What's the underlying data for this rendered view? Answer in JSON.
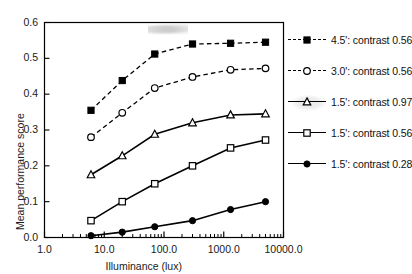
{
  "chart_data": {
    "type": "line",
    "title": "",
    "xlabel": "Illuminance (lux)",
    "ylabel": "Mean performance score",
    "x_scale": "log",
    "xlim": [
      1.0,
      10000.0
    ],
    "ylim": [
      0.0,
      0.6
    ],
    "grid": false,
    "legend_position": "right",
    "x_tick_labels": [
      "1.0",
      "10.0",
      "100.0",
      "1000.0",
      "10000.0"
    ],
    "x_tick_values": [
      1.0,
      10.0,
      100.0,
      1000.0,
      10000.0
    ],
    "y_tick_labels": [
      "0.0",
      "0.1",
      "0.2",
      "0.3",
      "0.4",
      "0.5",
      "0.6"
    ],
    "y_tick_values": [
      0.0,
      0.1,
      0.2,
      0.3,
      0.4,
      0.5,
      0.6
    ],
    "x": [
      6.0,
      20.0,
      70.0,
      300.0,
      1300.0,
      5000.0
    ],
    "series": [
      {
        "name": "4.5': contrast 0.56",
        "marker": "filled-square",
        "linestyle": "dashed",
        "color": "#000000",
        "values": [
          0.355,
          0.438,
          0.512,
          0.54,
          0.542,
          0.545
        ]
      },
      {
        "name": "3.0': contrast 0.56",
        "marker": "open-circle",
        "linestyle": "dashed",
        "color": "#000000",
        "values": [
          0.28,
          0.348,
          0.417,
          0.448,
          0.468,
          0.472
        ]
      },
      {
        "name": "1.5': contrast 0.97",
        "marker": "open-triangle",
        "linestyle": "solid",
        "color": "#000000",
        "values": [
          0.175,
          0.228,
          0.288,
          0.32,
          0.342,
          0.345
        ]
      },
      {
        "name": "1.5': contrast 0.56",
        "marker": "open-square",
        "linestyle": "solid",
        "color": "#000000",
        "values": [
          0.047,
          0.1,
          0.15,
          0.2,
          0.25,
          0.272
        ]
      },
      {
        "name": "1.5': contrast 0.28",
        "marker": "filled-circle",
        "linestyle": "solid",
        "color": "#000000",
        "values": [
          0.005,
          0.015,
          0.03,
          0.047,
          0.078,
          0.1
        ]
      }
    ]
  },
  "legend": {
    "items": [
      {
        "label": "4.5': contrast 0.56"
      },
      {
        "label": "3.0': contrast 0.56"
      },
      {
        "label": "1.5': contrast 0.97"
      },
      {
        "label": "1.5': contrast 0.56"
      },
      {
        "label": "1.5': contrast 0.28"
      }
    ]
  },
  "axes": {
    "x_title": "Illuminance (lux)",
    "y_title": "Mean performance score",
    "x_ticks": [
      "1.0",
      "10.0",
      "100.0",
      "1000.0",
      "10000.0"
    ],
    "y_ticks": [
      "0.6",
      "0.5",
      "0.4",
      "0.3",
      "0.2",
      "0.1",
      "0.0"
    ]
  }
}
